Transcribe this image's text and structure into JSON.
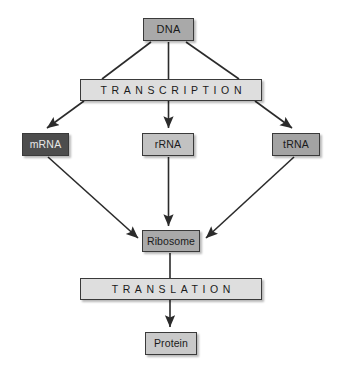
{
  "diagram": {
    "background_color": "#ffffff",
    "width": 340,
    "height": 371,
    "edge_color": "#2b2b2b",
    "nodes": [
      {
        "id": "dna",
        "label": "DNA",
        "shape": "rectangle",
        "fill": "#a9a9a9",
        "text_color": "#1a1a1a",
        "x": 143,
        "y": 18,
        "w": 51,
        "h": 23
      },
      {
        "id": "transcription",
        "label": "TRANSCRIPTION",
        "shape": "rectangle",
        "fill": "#dedede",
        "text_color": "#1a1a1a",
        "x": 80,
        "y": 79,
        "w": 182,
        "h": 22
      },
      {
        "id": "mrna",
        "label": "mRNA",
        "shape": "rectangle",
        "fill": "#4d4d4d",
        "text_color": "#e8e8e8",
        "x": 22,
        "y": 133,
        "w": 47,
        "h": 23
      },
      {
        "id": "rrna",
        "label": "rRNA",
        "shape": "rectangle",
        "fill": "#c2c2c2",
        "text_color": "#1a1a1a",
        "x": 142,
        "y": 133,
        "w": 52,
        "h": 23
      },
      {
        "id": "trna",
        "label": "tRNA",
        "shape": "rectangle",
        "fill": "#a3a3a3",
        "text_color": "#1a1a1a",
        "x": 272,
        "y": 133,
        "w": 48,
        "h": 23
      },
      {
        "id": "ribosome",
        "label": "Ribosome",
        "shape": "rectangle",
        "fill": "#a9a9a9",
        "text_color": "#1a1a1a",
        "x": 142,
        "y": 230,
        "w": 58,
        "h": 22
      },
      {
        "id": "translation",
        "label": "TRANSLATION",
        "shape": "rectangle",
        "fill": "#dedede",
        "text_color": "#1a1a1a",
        "x": 80,
        "y": 278,
        "w": 182,
        "h": 22
      },
      {
        "id": "protein",
        "label": "Protein",
        "shape": "rectangle",
        "fill": "#c9c9c9",
        "text_color": "#1a1a1a",
        "x": 145,
        "y": 332,
        "w": 52,
        "h": 23
      }
    ],
    "edges": [
      {
        "id": "dna-to-transcription-left",
        "from": "dna",
        "to": "transcription",
        "arrowhead": false
      },
      {
        "id": "dna-to-transcription-center",
        "from": "dna",
        "to": "transcription",
        "arrowhead": false
      },
      {
        "id": "dna-to-transcription-right",
        "from": "dna",
        "to": "transcription",
        "arrowhead": false
      },
      {
        "id": "transcription-to-mrna",
        "from": "transcription",
        "to": "mrna",
        "arrowhead": true
      },
      {
        "id": "transcription-to-rrna",
        "from": "transcription",
        "to": "rrna",
        "arrowhead": true
      },
      {
        "id": "transcription-to-trna",
        "from": "transcription",
        "to": "trna",
        "arrowhead": true
      },
      {
        "id": "mrna-to-ribosome",
        "from": "mrna",
        "to": "ribosome",
        "arrowhead": true
      },
      {
        "id": "rrna-to-ribosome",
        "from": "rrna",
        "to": "ribosome",
        "arrowhead": true
      },
      {
        "id": "trna-to-ribosome",
        "from": "trna",
        "to": "ribosome",
        "arrowhead": true
      },
      {
        "id": "ribosome-to-translation",
        "from": "ribosome",
        "to": "translation",
        "arrowhead": false
      },
      {
        "id": "translation-to-protein",
        "from": "translation",
        "to": "protein",
        "arrowhead": true
      }
    ]
  }
}
